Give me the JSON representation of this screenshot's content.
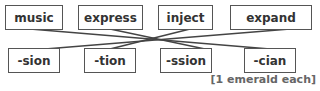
{
  "top_words": [
    "music",
    "express",
    "inject",
    "expand"
  ],
  "bottom_suffixes": [
    "-sion",
    "-tion",
    "-ssion",
    "-cian"
  ],
  "footer": "[1 emerald each]",
  "connections": [
    {
      "from": "music",
      "to": "-cian"
    },
    {
      "from": "express",
      "to": "-ssion"
    },
    {
      "from": "inject",
      "to": "-tion"
    },
    {
      "from": "expand",
      "to": "-sion"
    }
  ]
}
